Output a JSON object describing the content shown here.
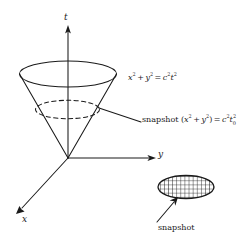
{
  "figure": {
    "name": "light-cone-spacetime-diagram",
    "background_color": "#ffffff",
    "stroke_color": "#1a1a1a",
    "axes": {
      "t_label": "t",
      "y_label": "y",
      "x_label": "x"
    },
    "labels": {
      "cone_equation_plain": "x² + y² = c²t²",
      "snapshot_equation_plain": "snapshot (x² + y²) = c²t₀²",
      "snapshot_caption": "snapshot",
      "snapshot_word": "snapshot"
    },
    "equation_tokens": {
      "x": "x",
      "y": "y",
      "c": "c",
      "t": "t",
      "two": "2",
      "zero": "0",
      "plus": "+",
      "equals": "=",
      "open_paren": "(",
      "close_paren": ")"
    },
    "shapes": {
      "cone_rim": "solid-ellipse",
      "cone_cross_section": "dashed-ellipse",
      "snapshot_disc": "hatched-ellipse"
    }
  }
}
